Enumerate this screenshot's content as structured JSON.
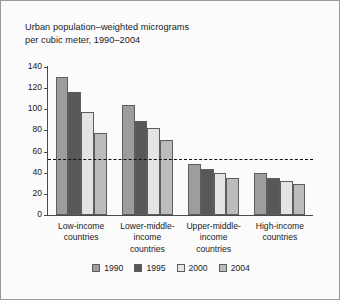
{
  "figure": {
    "title": "Urban population–weighted micrograms\nper cubic meter, 1990–2004",
    "background": "#fbfbfb",
    "border_color": "#9a9a9a"
  },
  "chart_data": {
    "type": "bar",
    "title": "Urban population–weighted micrograms per cubic meter, 1990–2004",
    "xlabel": "",
    "ylabel": "",
    "ylim": [
      0,
      140
    ],
    "yticks": [
      0,
      20,
      40,
      60,
      80,
      100,
      120,
      140
    ],
    "ytick_labels": [
      "0",
      "20",
      "40",
      "60",
      "80",
      "100",
      "120",
      "140"
    ],
    "grid": false,
    "legend_position": "bottom",
    "categories": [
      "Low-income\ncountries",
      "Lower-middle-\nincome\ncountries",
      "Upper-middle-\nincome\ncountries",
      "High-income\ncountries"
    ],
    "series": [
      {
        "name": "1990",
        "color": "#9d9d9d",
        "values": [
          131,
          104,
          48,
          40
        ]
      },
      {
        "name": "1995",
        "color": "#585858",
        "values": [
          116,
          89,
          44,
          35
        ]
      },
      {
        "name": "2000",
        "color": "#e4e4e4",
        "values": [
          97,
          82,
          40,
          32.5
        ]
      },
      {
        "name": "2004",
        "color": "#bcbcbc",
        "values": [
          78,
          71,
          35,
          29
        ]
      }
    ],
    "reference_line": {
      "value": 52,
      "style": "dashed",
      "color": "#111111"
    }
  },
  "legend": {
    "items": [
      {
        "label": "1990",
        "color": "#9d9d9d"
      },
      {
        "label": "1995",
        "color": "#585858"
      },
      {
        "label": "2000",
        "color": "#e4e4e4"
      },
      {
        "label": "2004",
        "color": "#bcbcbc"
      }
    ]
  }
}
